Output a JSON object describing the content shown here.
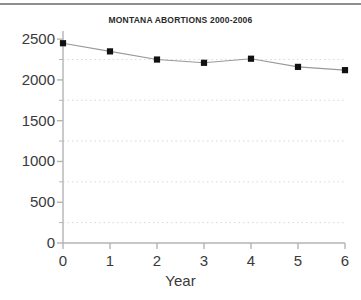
{
  "chart_data": {
    "type": "line",
    "title": "MONTANA ABORTIONS 2000-2006",
    "xlabel": "Year",
    "ylabel": "",
    "x": [
      0,
      1,
      2,
      3,
      4,
      5,
      6
    ],
    "categories": [
      "0",
      "1",
      "2",
      "3",
      "4",
      "5",
      "6"
    ],
    "values": [
      2450,
      2350,
      2250,
      2210,
      2260,
      2160,
      2120
    ],
    "series": [
      {
        "name": "Montana abortions",
        "values": [
          2450,
          2350,
          2250,
          2210,
          2260,
          2160,
          2120
        ]
      }
    ],
    "xlim": [
      0,
      6
    ],
    "ylim": [
      0,
      2600
    ],
    "ytick_labels": [
      "0",
      "500",
      "1000",
      "1500",
      "2000",
      "2500"
    ],
    "ytick_values": [
      0,
      500,
      1000,
      1500,
      2000,
      2500
    ],
    "yminor_values": [
      250,
      750,
      1250,
      1750,
      2250
    ],
    "xtick_labels": [
      "0",
      "1",
      "2",
      "3",
      "4",
      "5",
      "6"
    ],
    "xtick_values": [
      0,
      1,
      2,
      3,
      4,
      5,
      6
    ],
    "grid": "horizontal-dotted-minor",
    "legend": "none",
    "marker": "square",
    "line_color": "#999999",
    "marker_color": "#111111",
    "grid_color": "#d8d8d8",
    "axis_color": "#b4b4b4",
    "text_color": "#3a3a3a",
    "title_color": "#2a2a2a",
    "background": "#ffffff"
  }
}
